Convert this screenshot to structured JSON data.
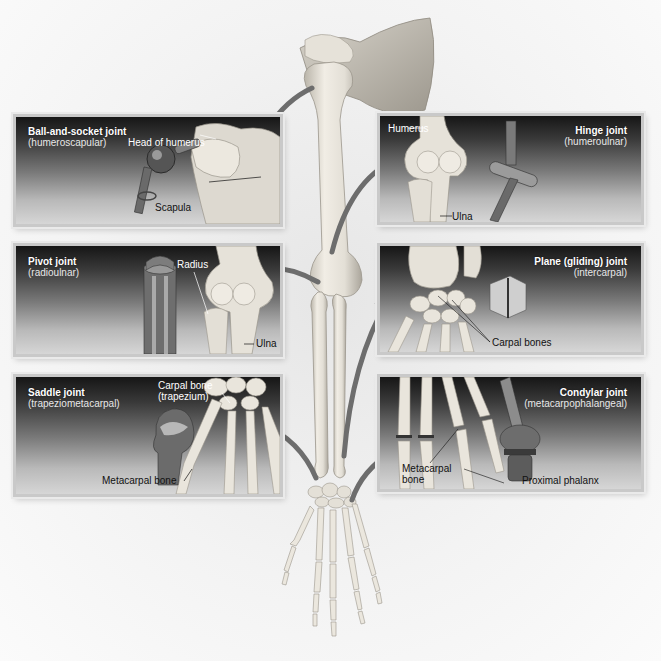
{
  "figure": {
    "header_fragment": "",
    "colors": {
      "panel_top": "#161616",
      "panel_bottom": "#d6d6d6",
      "panel_border": "#c9c9c9",
      "bone": "#e9e5dc",
      "bone_shadow": "#b8b3a8",
      "arrow": "#6d6d6d",
      "model_metal": "#8a8a8a",
      "model_dark": "#4a4a4a"
    }
  },
  "panels": [
    {
      "id": "ball-and-socket",
      "title": "Ball-and-socket joint",
      "subtitle": "(humeroscapular)",
      "labels": [
        "Head of humerus",
        "Scapula"
      ]
    },
    {
      "id": "hinge",
      "title": "Hinge joint",
      "subtitle": "(humeroulnar)",
      "labels": [
        "Humerus",
        "Ulna"
      ]
    },
    {
      "id": "pivot",
      "title": "Pivot joint",
      "subtitle": "(radioulnar)",
      "labels": [
        "Radius",
        "Ulna"
      ]
    },
    {
      "id": "plane",
      "title": "Plane (gliding) joint",
      "subtitle": "(intercarpal)",
      "labels": [
        "Carpal bones"
      ]
    },
    {
      "id": "saddle",
      "title": "Saddle joint",
      "subtitle": "(trapeziometacarpal)",
      "labels": [
        "Carpal bone",
        "(trapezium)",
        "Metacarpal bone"
      ]
    },
    {
      "id": "condylar",
      "title": "Condylar joint",
      "subtitle": "(metacarpophalangeal)",
      "labels": [
        "Metacarpal",
        "bone",
        "Proximal phalanx"
      ]
    }
  ]
}
